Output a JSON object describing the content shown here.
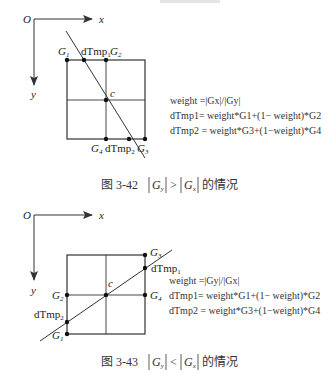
{
  "figures": [
    {
      "id": "fig-3-42",
      "caption": {
        "number": "图 3-42",
        "condition_left": "G",
        "condition_left_sub": "y",
        "relation": ">",
        "condition_right": "G",
        "condition_right_sub": "x",
        "suffix": "的情况"
      },
      "axes": {
        "origin": "O",
        "x": "x",
        "y": "y"
      },
      "center_label": "c",
      "points": {
        "G1": {
          "label": "G",
          "sub": "1"
        },
        "G2": {
          "label": "G",
          "sub": "2"
        },
        "G3": {
          "label": "G",
          "sub": "3"
        },
        "G4": {
          "label": "G",
          "sub": "4"
        },
        "dTmp1": {
          "label": "dTmp",
          "sub": "1"
        },
        "dTmp2": {
          "label": "dTmp",
          "sub": "2"
        }
      },
      "equations": [
        "weight =|Gx|/|Gy|",
        "dTmp1= weight*G1+(1− weight)*G2",
        "dTmp2 = weight*G3+(1−weight)*G4"
      ]
    },
    {
      "id": "fig-3-43",
      "caption": {
        "number": "图 3-43",
        "condition_left": "G",
        "condition_left_sub": "y",
        "relation": "<",
        "condition_right": "G",
        "condition_right_sub": "x",
        "suffix": "的情况"
      },
      "axes": {
        "origin": "O",
        "x": "x",
        "y": "y"
      },
      "center_label": "c",
      "points": {
        "G1": {
          "label": "G",
          "sub": "1"
        },
        "G2": {
          "label": "G",
          "sub": "2"
        },
        "G3": {
          "label": "G",
          "sub": "3"
        },
        "G4": {
          "label": "G",
          "sub": "4"
        },
        "dTmp1": {
          "label": "dTmp",
          "sub": "1"
        },
        "dTmp2": {
          "label": "dTmp",
          "sub": "2"
        }
      },
      "equations": [
        "weight =|Gy|/|Gx|",
        "dTmp1= weight*G1+(1− weight)*G2",
        "dTmp2 = weight*G3+(1−weight)*G4"
      ]
    }
  ]
}
